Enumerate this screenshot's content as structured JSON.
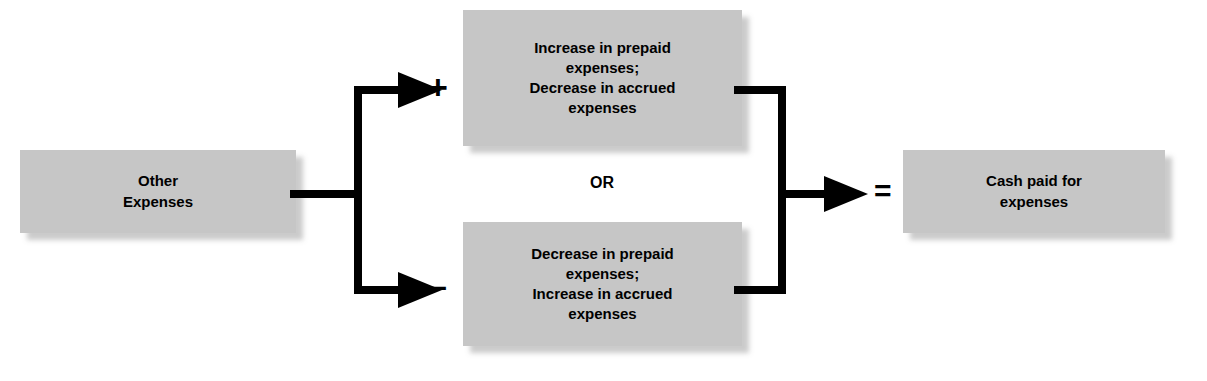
{
  "diagram": {
    "accent_fill": "#c6c6c6",
    "stroke_color": "#000000",
    "boxes": {
      "source": {
        "id": "other-expenses",
        "text": "Other\nExpenses"
      },
      "adjustment_add": {
        "id": "increase-prepaid",
        "text": "Increase in prepaid\nexpenses;\nDecrease in accrued\nexpenses"
      },
      "adjustment_subtract": {
        "id": "decrease-prepaid",
        "text": "Decrease in prepaid\nexpenses;\nIncrease in accrued\nexpenses"
      },
      "result": {
        "id": "cash-paid",
        "text": "Cash paid for\nexpenses"
      }
    },
    "operators": {
      "plus": "+",
      "minus": "–",
      "equals": "=",
      "or": "OR"
    }
  }
}
